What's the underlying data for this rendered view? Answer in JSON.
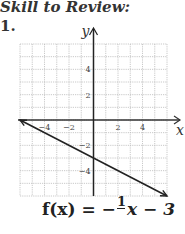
{
  "heading": "Skill to Review:",
  "problem_number": "1.",
  "formula": {
    "lhs": "f(x) = −",
    "numerator": "1",
    "denominator": "2",
    "rhs": "x − 3"
  },
  "chart_data": {
    "type": "line",
    "title": "",
    "xlabel": "x",
    "ylabel": "y",
    "xlim": [
      -6,
      6
    ],
    "ylim": [
      -6,
      6
    ],
    "grid": true,
    "x_ticks": [
      -4,
      -2,
      2,
      4
    ],
    "y_ticks": [
      4,
      2,
      -2,
      -4
    ],
    "x_tick_labels": [
      "−4",
      "−2",
      "2",
      "4"
    ],
    "y_tick_labels": [
      "4",
      "2",
      "−2",
      "−4"
    ],
    "series": [
      {
        "name": "f(x) = -1/2 x - 3",
        "x": [
          -6,
          0,
          6
        ],
        "y": [
          0,
          -3,
          -6
        ],
        "slope": -0.5,
        "intercept": -3,
        "arrows": "both"
      }
    ]
  }
}
